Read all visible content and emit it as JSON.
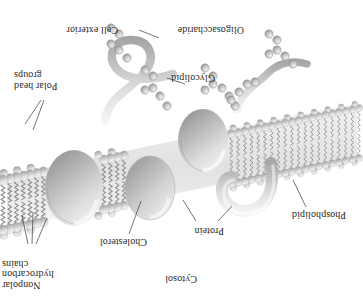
{
  "figure": {
    "orientation": "rotated-180",
    "background_color": "#ffffff",
    "ink_color": "#2b2b2b",
    "style": "grayscale airbrush textbook illustration"
  },
  "labels": {
    "cytosol": "Cytosol",
    "nonpolar_hydrocarbon_chains": "Nonpolar\nhydrocarbon\nchains",
    "cholesterol": "Cholesterol",
    "protein": "Protein",
    "phospholipid": "Phospholipid",
    "polar_head_groups": "Polar\nhead\ngroups",
    "glycolipid": "Glycolipid",
    "oligosaccharide": "Oligosaccharide",
    "cell_exterior": "Cell exterior"
  },
  "components": {
    "bilayer": {
      "name": "phospholipid bilayer",
      "leaflets": 2,
      "head_group_shape": "sphere",
      "tail_shape": "zigzag hydrocarbon chain",
      "head_fill": "#e8e8e8",
      "tail_fill": "#8a8a8a"
    },
    "proteins": [
      {
        "name": "hook-shaped peripheral protein",
        "fill": "#d9d9d9"
      },
      {
        "name": "integral membrane protein (left ellipsoid)",
        "fill": "#dcdcdc"
      },
      {
        "name": "integral membrane protein (right ellipsoid)",
        "fill": "#d6d6d6"
      },
      {
        "name": "transmembrane protein with extracellular loop",
        "fill": "#dadada"
      }
    ],
    "sugars": {
      "name": "oligosaccharide bead chains",
      "bead_fill": "#bdbdbd",
      "bead_count": 26
    },
    "cholesterol": {
      "name": "cholesterol molecule",
      "fill": "#cfcfcf"
    }
  }
}
